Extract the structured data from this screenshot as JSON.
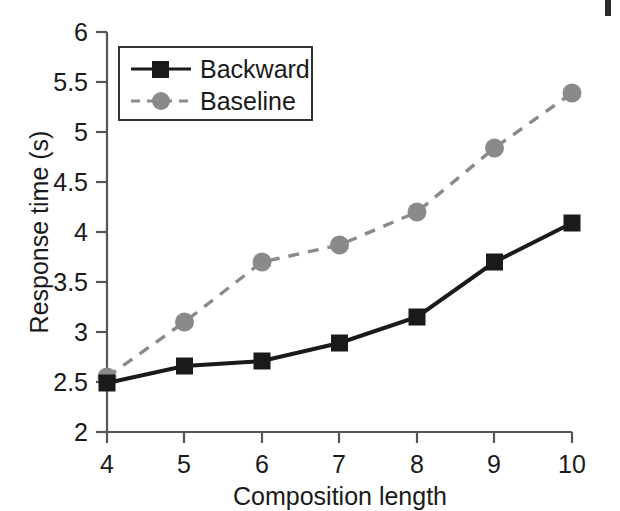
{
  "chart_data": {
    "type": "line",
    "title": "",
    "xlabel": "Composition length",
    "ylabel": "Response time (s)",
    "x": [
      4,
      5,
      6,
      7,
      8,
      9,
      10
    ],
    "xlim": [
      4,
      10
    ],
    "ylim": [
      2,
      6
    ],
    "xticks": [
      "4",
      "5",
      "6",
      "7",
      "8",
      "9",
      "10"
    ],
    "yticks": [
      "2",
      "2.5",
      "3",
      "3.5",
      "4",
      "4.5",
      "5",
      "5.5",
      "6"
    ],
    "grid": false,
    "legend_position": "top-left",
    "series": [
      {
        "name": "Backward",
        "values": [
          2.49,
          2.66,
          2.71,
          2.89,
          3.15,
          3.7,
          4.09
        ],
        "color": "#1a1a1a",
        "linestyle": "solid",
        "marker": "square"
      },
      {
        "name": "Baseline",
        "values": [
          2.55,
          3.1,
          3.7,
          3.87,
          4.2,
          4.84,
          5.39
        ],
        "color": "#808080",
        "linestyle": "dashed",
        "marker": "circle"
      }
    ]
  },
  "legend": {
    "entries": [
      {
        "label": "Backward"
      },
      {
        "label": "Baseline"
      }
    ]
  },
  "axes": {
    "x_title": "Composition length",
    "y_title": "Response time (s)"
  },
  "colors": {
    "backward": "#1a1a1a",
    "baseline": "#808080",
    "axis": "#555555",
    "background": "#ffffff"
  }
}
